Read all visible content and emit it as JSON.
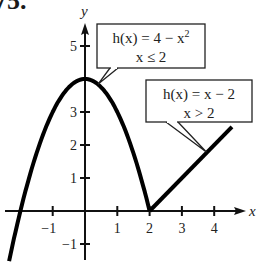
{
  "problem_number": "75.",
  "chart_data": {
    "type": "line",
    "title": "",
    "xlabel": "x",
    "ylabel": "y",
    "xlim": [
      -2.4,
      4.7
    ],
    "ylim": [
      -1.5,
      5.6
    ],
    "x_ticks": [
      -1,
      1,
      2,
      3,
      4
    ],
    "x_tick_labels": [
      "−1",
      "1",
      "2",
      "3",
      "4"
    ],
    "y_ticks": [
      -1,
      1,
      2,
      3,
      5
    ],
    "y_tick_labels": [
      "−1",
      "1",
      "2",
      "3",
      "5"
    ],
    "grid": false,
    "series": [
      {
        "name": "h(x) = 4 − x², x ≤ 2",
        "formula": "4 - x^2",
        "domain": [
          -2.35,
          2
        ],
        "points": [
          [
            -2.35,
            -1.52
          ],
          [
            -2,
            0
          ],
          [
            -1,
            3
          ],
          [
            0,
            4
          ],
          [
            1,
            3
          ],
          [
            2,
            0
          ]
        ]
      },
      {
        "name": "h(x) = x − 2, x > 2",
        "formula": "x - 2",
        "domain": [
          2,
          4.55
        ],
        "points": [
          [
            2,
            0
          ],
          [
            3,
            1
          ],
          [
            4,
            2
          ],
          [
            4.55,
            2.55
          ]
        ]
      }
    ],
    "annotations": [
      {
        "line1": "h(x) = 4 − x",
        "sup": "2",
        "line2": "x ≤ 2",
        "points_to": [
          0.4,
          3.84
        ]
      },
      {
        "line1": "h(x) = x − 2",
        "sup": "",
        "line2": "x > 2",
        "points_to": [
          3.85,
          1.85
        ]
      }
    ]
  }
}
